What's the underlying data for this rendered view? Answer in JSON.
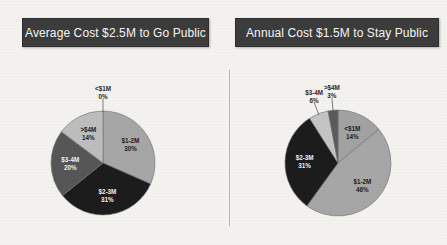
{
  "background_color": "#f3f2ef",
  "divider": {
    "name": "vertical-divider",
    "color": "#b9b9b7"
  },
  "panels": [
    {
      "id": "go-public",
      "title": "Average Cost $2.5M to Go Public",
      "title_bg": "#3c3c3c",
      "title_color": "#f4f4f4"
    },
    {
      "id": "stay-public",
      "title": "Annual Cost $1.5M to Stay Public",
      "title_bg": "#3c3c3c",
      "title_color": "#f4f4f4"
    }
  ],
  "chart_data": [
    {
      "type": "pie",
      "id": "go-public",
      "title": "Average Cost $2.5M to Go Public",
      "categories": [
        "<$1M",
        "$1-2M",
        "$2-3M",
        "$3-4M",
        ">$4M"
      ],
      "values": [
        0,
        30,
        31,
        20,
        14
      ],
      "value_labels": [
        "0%",
        "30%",
        "31%",
        "20%",
        "14%"
      ],
      "colors": [
        "#c9c9c9",
        "#a6a6a6",
        "#1c1c1c",
        "#565656",
        "#bdbdbd"
      ],
      "label_positions": [
        "outside",
        "inside",
        "inside",
        "inside",
        "inside"
      ],
      "label_colors": [
        "dark",
        "dark",
        "light",
        "light",
        "dark"
      ],
      "start_angle": 0,
      "legend": "none",
      "grid": false
    },
    {
      "type": "pie",
      "id": "stay-public",
      "title": "Annual Cost $1.5M to Stay Public",
      "categories": [
        "<$1M",
        "$1-2M",
        "$2-3M",
        "$3-4M",
        ">$4M"
      ],
      "values": [
        14,
        46,
        31,
        6,
        3
      ],
      "value_labels": [
        "14%",
        "46%",
        "31%",
        "6%",
        "3%"
      ],
      "colors": [
        "#a2a2a2",
        "#a6a6a6",
        "#1c1c1c",
        "#c4c4c4",
        "#5a5a5a"
      ],
      "label_positions": [
        "inside",
        "inside",
        "inside",
        "outside",
        "outside"
      ],
      "label_colors": [
        "dark",
        "dark",
        "light",
        "dark",
        "dark"
      ],
      "start_angle": 0,
      "legend": "none",
      "grid": false
    }
  ]
}
